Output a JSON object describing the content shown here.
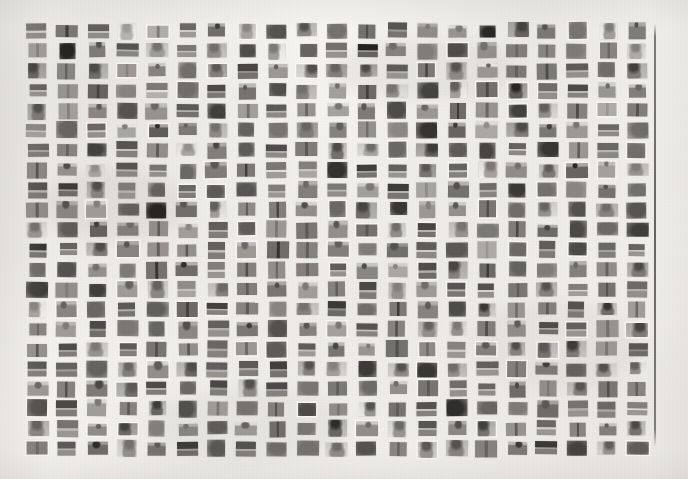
{
  "figure": {
    "kind": "scanned-thumbnail-montage",
    "media": "grayscale scanned page",
    "background_color": "#f7f6f4",
    "ink_color": "#4a4845",
    "rule_color": "#55534f",
    "canvas": {
      "width": 688,
      "height": 479
    }
  },
  "grid": {
    "columns": 21,
    "rows": 22,
    "total_thumbnails": 462,
    "origin_x": 22,
    "origin_y": 21,
    "cell_width": 30,
    "cell_height": 19.9,
    "thumb_width": 19,
    "thumb_height": 14,
    "content": "small grayscale pedestrian / person crop thumbnails"
  },
  "margin_rule": {
    "x": 654,
    "y_top": 24,
    "y_bottom": 446,
    "thickness": 1.6
  },
  "chart_data": {
    "type": "heatmap",
    "title": "",
    "xlabel": "",
    "ylabel": "",
    "legend": [],
    "grid": false,
    "columns": 21,
    "rows": 22,
    "cells": [
      [
        32,
        38,
        36,
        22,
        24,
        30,
        46,
        28,
        44,
        34,
        26,
        40,
        42,
        36,
        30,
        44,
        48,
        38,
        30,
        26,
        42
      ],
      [
        28,
        42,
        40,
        38,
        30,
        34,
        36,
        40,
        26,
        36,
        30,
        44,
        34,
        28,
        42,
        32,
        40,
        36,
        34,
        38,
        24
      ],
      [
        44,
        38,
        40,
        30,
        36,
        26,
        38,
        44,
        32,
        34,
        40,
        36,
        30,
        42,
        34,
        28,
        38,
        42,
        30,
        34,
        40
      ],
      [
        34,
        32,
        44,
        28,
        22,
        36,
        38,
        40,
        44,
        36,
        30,
        42,
        34,
        38,
        26,
        40,
        44,
        32,
        36,
        30,
        38
      ],
      [
        40,
        26,
        34,
        36,
        30,
        42,
        36,
        30,
        38,
        34,
        28,
        40,
        36,
        32,
        44,
        30,
        38,
        34,
        40,
        26,
        36
      ],
      [
        30,
        30,
        32,
        26,
        46,
        38,
        34,
        36,
        30,
        42,
        40,
        34,
        28,
        38,
        42,
        26,
        36,
        40,
        32,
        34,
        30
      ],
      [
        38,
        34,
        40,
        36,
        32,
        28,
        42,
        30,
        34,
        38,
        40,
        26,
        36,
        44,
        30,
        38,
        34,
        42,
        28,
        36,
        40
      ],
      [
        36,
        30,
        28,
        38,
        34,
        32,
        40,
        36,
        30,
        26,
        38,
        42,
        34,
        40,
        36,
        28,
        32,
        38,
        44,
        30,
        34
      ],
      [
        42,
        40,
        34,
        30,
        26,
        36,
        38,
        44,
        32,
        40,
        34,
        30,
        38,
        26,
        42,
        36,
        40,
        34,
        30,
        38,
        32
      ],
      [
        34,
        38,
        30,
        36,
        42,
        40,
        28,
        34,
        38,
        30,
        36,
        44,
        40,
        32,
        34,
        38,
        26,
        30,
        36,
        40,
        34
      ],
      [
        30,
        36,
        44,
        38,
        34,
        30,
        40,
        36,
        28,
        42,
        32,
        38,
        34,
        40,
        30,
        34,
        38,
        42,
        36,
        28,
        40
      ],
      [
        38,
        32,
        36,
        40,
        30,
        34,
        38,
        28,
        44,
        36,
        40,
        30,
        42,
        34,
        38,
        26,
        34,
        36,
        40,
        38,
        30
      ],
      [
        36,
        40,
        34,
        28,
        38,
        42,
        30,
        40,
        34,
        36,
        30,
        38,
        26,
        40,
        34,
        42,
        36,
        30,
        38,
        34,
        40
      ],
      [
        40,
        34,
        38,
        30,
        36,
        28,
        34,
        38,
        42,
        30,
        36,
        40,
        34,
        28,
        38,
        32,
        40,
        36,
        30,
        42,
        34
      ],
      [
        28,
        38,
        36,
        42,
        30,
        40,
        36,
        34,
        28,
        38,
        42,
        30,
        36,
        34,
        40,
        38,
        30,
        34,
        36,
        40,
        26
      ],
      [
        36,
        30,
        40,
        34,
        38,
        36,
        30,
        42,
        34,
        40,
        28,
        36,
        38,
        30,
        34,
        40,
        36,
        42,
        30,
        34,
        38
      ],
      [
        34,
        42,
        30,
        36,
        40,
        34,
        38,
        30,
        36,
        28,
        40,
        34,
        42,
        36,
        30,
        38,
        34,
        40,
        36,
        30,
        42
      ],
      [
        40,
        36,
        34,
        38,
        30,
        42,
        34,
        36,
        40,
        34,
        30,
        38,
        36,
        42,
        34,
        30,
        40,
        36,
        38,
        34,
        30
      ],
      [
        30,
        34,
        38,
        40,
        36,
        30,
        42,
        34,
        38,
        36,
        40,
        30,
        34,
        38,
        30,
        36,
        42,
        34,
        40,
        38,
        36
      ],
      [
        38,
        40,
        30,
        34,
        42,
        36,
        30,
        38,
        34,
        40,
        36,
        30,
        38,
        34,
        42,
        36,
        30,
        40,
        34,
        38,
        30
      ],
      [
        34,
        28,
        36,
        40,
        30,
        38,
        34,
        30,
        40,
        36,
        42,
        34,
        30,
        38,
        36,
        40,
        34,
        30,
        38,
        36,
        40
      ],
      [
        36,
        34,
        40,
        30,
        38,
        42,
        34,
        36,
        30,
        40,
        34,
        38,
        36,
        30,
        40,
        34,
        38,
        36,
        42,
        30,
        34
      ]
    ]
  },
  "annotations": {
    "text_items": [],
    "caption": ""
  }
}
